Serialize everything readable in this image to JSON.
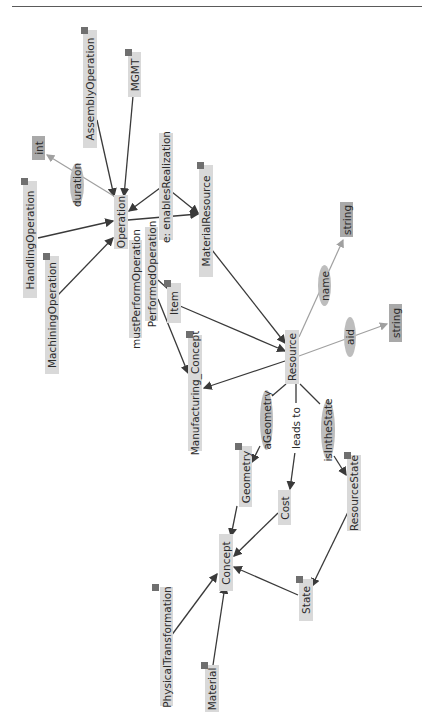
{
  "diagram": {
    "orientation": "rotated-90-ccw",
    "colors": {
      "class_box": "#d9d9d9",
      "datatype_box": "#a9a9a9",
      "property_ellipse": "#bdbdbd",
      "edge_dark": "#3a3a3a",
      "edge_light": "#a0a0a0",
      "badge": "#6f6f6f",
      "text": "#2b2b2b"
    },
    "nodes": {
      "assembly_operation": {
        "label": "AssemblyOperation",
        "type": "class",
        "badge": true
      },
      "mgmt": {
        "label": "MGMT",
        "type": "class",
        "badge": true
      },
      "int": {
        "label": "int",
        "type": "datatype",
        "badge": false
      },
      "duration": {
        "label": "duration",
        "type": "data-property",
        "badge": false
      },
      "handling_operation": {
        "label": "HandlingOperation",
        "type": "class",
        "badge": true
      },
      "machining_operation": {
        "label": "MachiningOperation",
        "type": "class",
        "badge": true
      },
      "operation": {
        "label": "Operation",
        "type": "class",
        "badge": false
      },
      "enables_realization": {
        "label": "e: enablesRealization",
        "type": "object-property",
        "badge": false
      },
      "material_resource": {
        "label": "MaterialResource",
        "type": "class",
        "badge": true
      },
      "must_perform_operation": {
        "label": "mustPerformOperation",
        "type": "object-property",
        "badge": false
      },
      "performed_operation": {
        "label": "PerformedOperation",
        "type": "class",
        "badge": false
      },
      "item": {
        "label": "Item",
        "type": "class",
        "badge": true
      },
      "manufacturing_concept": {
        "label": "Manufacturing_Concept",
        "type": "class",
        "badge": true
      },
      "resource": {
        "label": "Resource",
        "type": "class",
        "badge": false
      },
      "name": {
        "label": "name",
        "type": "data-property",
        "badge": false
      },
      "string_top": {
        "label": "string",
        "type": "datatype",
        "badge": false
      },
      "aid": {
        "label": "aid",
        "type": "data-property",
        "badge": false
      },
      "string_right": {
        "label": "string",
        "type": "datatype",
        "badge": false
      },
      "a_geometry": {
        "label": "aGeometry",
        "type": "object-property",
        "badge": false
      },
      "leads_to": {
        "label": "leads to",
        "type": "object-property",
        "badge": false
      },
      "is_in_the_state": {
        "label": "isIntheState",
        "type": "object-property",
        "badge": false
      },
      "geometry": {
        "label": "Geometry",
        "type": "class",
        "badge": true
      },
      "cost": {
        "label": "Cost",
        "type": "class",
        "badge": false
      },
      "resource_state": {
        "label": "ResourceState",
        "type": "class",
        "badge": true
      },
      "concept": {
        "label": "Concept",
        "type": "class",
        "badge": false
      },
      "state": {
        "label": "State",
        "type": "class",
        "badge": true
      },
      "physical_transformation": {
        "label": "PhysicalTransformation",
        "type": "class",
        "badge": true
      },
      "material": {
        "label": "Material",
        "type": "class",
        "badge": true
      }
    },
    "edges": [
      {
        "from": "AssemblyOperation",
        "to": "Operation",
        "style": "dark"
      },
      {
        "from": "MGMT",
        "to": "Operation",
        "style": "dark"
      },
      {
        "from": "HandlingOperation",
        "to": "Operation",
        "style": "dark"
      },
      {
        "from": "MachiningOperation",
        "to": "Operation",
        "style": "dark"
      },
      {
        "from": "Operation",
        "to": "int",
        "via": "duration",
        "style": "light"
      },
      {
        "from": "e: enablesRealization",
        "to": "Operation",
        "style": "dark"
      },
      {
        "from": "e: enablesRealization",
        "to": "MaterialResource",
        "style": "dark"
      },
      {
        "from": "Operation",
        "to": "MaterialResource",
        "style": "dark"
      },
      {
        "from": "MaterialResource",
        "to": "Resource",
        "style": "dark"
      },
      {
        "from": "PerformedOperation",
        "to": "Manufacturing_Concept",
        "style": "dark"
      },
      {
        "from": "Item",
        "to": "Resource",
        "style": "dark"
      },
      {
        "from": "Resource",
        "to": "Manufacturing_Concept",
        "style": "dark"
      },
      {
        "from": "Resource",
        "to": "string",
        "via": "name",
        "style": "light"
      },
      {
        "from": "Resource",
        "to": "string",
        "via": "aid",
        "style": "light"
      },
      {
        "from": "Resource",
        "to": "Geometry",
        "via": "aGeometry",
        "style": "dark"
      },
      {
        "from": "Resource",
        "to": "Cost",
        "via": "leads to",
        "style": "dark"
      },
      {
        "from": "Resource",
        "to": "ResourceState",
        "via": "isIntheState",
        "style": "dark"
      },
      {
        "from": "Geometry",
        "to": "Concept",
        "style": "dark"
      },
      {
        "from": "Cost",
        "to": "Concept",
        "style": "dark"
      },
      {
        "from": "ResourceState",
        "to": "State",
        "style": "dark"
      },
      {
        "from": "State",
        "to": "Concept",
        "style": "dark"
      },
      {
        "from": "PhysicalTransformation",
        "to": "Concept",
        "style": "dark"
      },
      {
        "from": "Material",
        "to": "Concept",
        "style": "dark"
      }
    ]
  }
}
